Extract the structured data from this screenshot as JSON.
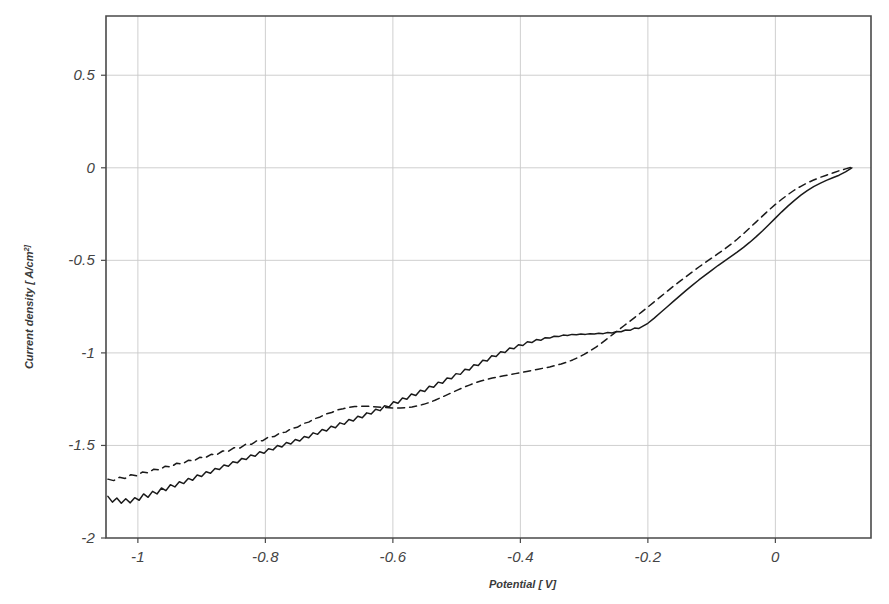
{
  "chart_data": {
    "type": "line",
    "title": "",
    "xlabel": "Potential [ V]",
    "ylabel": "Current density [ A/cm 2]",
    "ylabel_base": "Current density [ A/cm",
    "ylabel_exp": "2]",
    "xlim": [
      -1.05,
      0.15
    ],
    "ylim": [
      -2.0,
      0.82
    ],
    "grid": true,
    "legend": "none",
    "xticks": [
      -1,
      -0.8,
      -0.6,
      -0.4,
      -0.2,
      0
    ],
    "xticklabels": [
      "-1",
      "-0.8",
      "-0.6",
      "-0.4",
      "-0.2",
      "0"
    ],
    "yticks": [
      0.5,
      0,
      -0.5,
      -1,
      -1.5,
      -2
    ],
    "yticklabels": [
      "0.5",
      "0",
      "-0.5",
      "-1",
      "-1.5",
      "-2"
    ],
    "series": [
      {
        "name": "solid-curve",
        "style": "solid",
        "color": "#1a1a1a",
        "x": [
          -1.047,
          -1.04,
          -1.033,
          -1.026,
          -1.019,
          -1.012,
          -1.005,
          -0.998,
          -0.991,
          -0.984,
          -0.977,
          -0.97,
          -0.963,
          -0.956,
          -0.949,
          -0.942,
          -0.935,
          -0.928,
          -0.921,
          -0.914,
          -0.907,
          -0.9,
          -0.893,
          -0.886,
          -0.879,
          -0.872,
          -0.865,
          -0.858,
          -0.851,
          -0.844,
          -0.837,
          -0.83,
          -0.823,
          -0.816,
          -0.809,
          -0.802,
          -0.795,
          -0.788,
          -0.781,
          -0.774,
          -0.767,
          -0.76,
          -0.753,
          -0.746,
          -0.739,
          -0.732,
          -0.725,
          -0.718,
          -0.711,
          -0.704,
          -0.697,
          -0.69,
          -0.683,
          -0.676,
          -0.669,
          -0.662,
          -0.655,
          -0.648,
          -0.641,
          -0.634,
          -0.627,
          -0.62,
          -0.613,
          -0.606,
          -0.599,
          -0.592,
          -0.585,
          -0.578,
          -0.571,
          -0.564,
          -0.557,
          -0.55,
          -0.543,
          -0.536,
          -0.529,
          -0.522,
          -0.515,
          -0.508,
          -0.501,
          -0.494,
          -0.487,
          -0.48,
          -0.473,
          -0.466,
          -0.459,
          -0.452,
          -0.445,
          -0.438,
          -0.431,
          -0.424,
          -0.417,
          -0.41,
          -0.403,
          -0.396,
          -0.389,
          -0.382,
          -0.375,
          -0.368,
          -0.361,
          -0.354,
          -0.347,
          -0.34,
          -0.333,
          -0.326,
          -0.319,
          -0.312,
          -0.305,
          -0.298,
          -0.291,
          -0.284,
          -0.277,
          -0.27,
          -0.263,
          -0.256,
          -0.249,
          -0.242,
          -0.235,
          -0.228,
          -0.221,
          -0.214,
          -0.207,
          -0.2,
          -0.19,
          -0.18,
          -0.17,
          -0.16,
          -0.15,
          -0.14,
          -0.13,
          -0.12,
          -0.11,
          -0.1,
          -0.09,
          -0.08,
          -0.07,
          -0.06,
          -0.05,
          -0.04,
          -0.03,
          -0.02,
          -0.01,
          0.0,
          0.01,
          0.02,
          0.03,
          0.04,
          0.05,
          0.06,
          0.07,
          0.08,
          0.09,
          0.1,
          0.11,
          0.12
        ],
        "y": [
          -1.775,
          -1.806,
          -1.784,
          -1.812,
          -1.788,
          -1.81,
          -1.782,
          -1.796,
          -1.762,
          -1.78,
          -1.748,
          -1.762,
          -1.73,
          -1.744,
          -1.712,
          -1.724,
          -1.696,
          -1.706,
          -1.678,
          -1.688,
          -1.66,
          -1.668,
          -1.642,
          -1.65,
          -1.624,
          -1.63,
          -1.606,
          -1.612,
          -1.588,
          -1.594,
          -1.57,
          -1.576,
          -1.552,
          -1.558,
          -1.534,
          -1.542,
          -1.518,
          -1.524,
          -1.5,
          -1.508,
          -1.484,
          -1.492,
          -1.468,
          -1.476,
          -1.452,
          -1.458,
          -1.432,
          -1.44,
          -1.414,
          -1.422,
          -1.396,
          -1.404,
          -1.378,
          -1.386,
          -1.36,
          -1.368,
          -1.342,
          -1.35,
          -1.324,
          -1.33,
          -1.304,
          -1.312,
          -1.286,
          -1.292,
          -1.264,
          -1.272,
          -1.244,
          -1.25,
          -1.222,
          -1.23,
          -1.202,
          -1.208,
          -1.18,
          -1.186,
          -1.158,
          -1.164,
          -1.136,
          -1.14,
          -1.112,
          -1.116,
          -1.088,
          -1.092,
          -1.064,
          -1.068,
          -1.04,
          -1.044,
          -1.016,
          -1.02,
          -0.994,
          -0.998,
          -0.974,
          -0.978,
          -0.956,
          -0.96,
          -0.94,
          -0.944,
          -0.928,
          -0.932,
          -0.918,
          -0.92,
          -0.91,
          -0.912,
          -0.904,
          -0.906,
          -0.9,
          -0.902,
          -0.898,
          -0.9,
          -0.896,
          -0.898,
          -0.894,
          -0.896,
          -0.89,
          -0.892,
          -0.884,
          -0.886,
          -0.876,
          -0.878,
          -0.866,
          -0.868,
          -0.854,
          -0.84,
          -0.812,
          -0.782,
          -0.752,
          -0.722,
          -0.692,
          -0.662,
          -0.634,
          -0.606,
          -0.58,
          -0.554,
          -0.528,
          -0.504,
          -0.48,
          -0.456,
          -0.43,
          -0.402,
          -0.372,
          -0.34,
          -0.306,
          -0.272,
          -0.238,
          -0.206,
          -0.176,
          -0.148,
          -0.124,
          -0.102,
          -0.084,
          -0.068,
          -0.054,
          -0.04,
          -0.022,
          0.0
        ]
      },
      {
        "name": "dashed-curve",
        "style": "dashed",
        "color": "#1a1a1a",
        "x": [
          -1.047,
          -1.038,
          -1.029,
          -1.02,
          -1.011,
          -1.002,
          -0.993,
          -0.984,
          -0.975,
          -0.966,
          -0.957,
          -0.948,
          -0.939,
          -0.93,
          -0.921,
          -0.912,
          -0.903,
          -0.894,
          -0.885,
          -0.876,
          -0.867,
          -0.858,
          -0.849,
          -0.84,
          -0.831,
          -0.822,
          -0.813,
          -0.804,
          -0.795,
          -0.786,
          -0.777,
          -0.768,
          -0.759,
          -0.75,
          -0.741,
          -0.732,
          -0.723,
          -0.714,
          -0.705,
          -0.696,
          -0.687,
          -0.678,
          -0.669,
          -0.66,
          -0.651,
          -0.642,
          -0.633,
          -0.624,
          -0.615,
          -0.606,
          -0.597,
          -0.588,
          -0.579,
          -0.57,
          -0.561,
          -0.552,
          -0.543,
          -0.534,
          -0.525,
          -0.516,
          -0.507,
          -0.498,
          -0.489,
          -0.48,
          -0.471,
          -0.462,
          -0.453,
          -0.444,
          -0.435,
          -0.426,
          -0.417,
          -0.408,
          -0.399,
          -0.39,
          -0.381,
          -0.372,
          -0.363,
          -0.354,
          -0.345,
          -0.336,
          -0.327,
          -0.318,
          -0.309,
          -0.3,
          -0.291,
          -0.282,
          -0.273,
          -0.264,
          -0.255,
          -0.246,
          -0.237,
          -0.228,
          -0.219,
          -0.21,
          -0.2,
          -0.19,
          -0.18,
          -0.17,
          -0.16,
          -0.15,
          -0.14,
          -0.13,
          -0.12,
          -0.11,
          -0.1,
          -0.09,
          -0.08,
          -0.07,
          -0.06,
          -0.05,
          -0.04,
          -0.03,
          -0.02,
          -0.01,
          0.0,
          0.01,
          0.02,
          0.03,
          0.04,
          0.05,
          0.06,
          0.07,
          0.08,
          0.09,
          0.1,
          0.11,
          0.12
        ],
        "y": [
          -1.682,
          -1.69,
          -1.672,
          -1.678,
          -1.658,
          -1.664,
          -1.644,
          -1.648,
          -1.628,
          -1.632,
          -1.612,
          -1.616,
          -1.596,
          -1.6,
          -1.58,
          -1.584,
          -1.564,
          -1.566,
          -1.548,
          -1.55,
          -1.53,
          -1.532,
          -1.512,
          -1.514,
          -1.494,
          -1.494,
          -1.474,
          -1.474,
          -1.454,
          -1.452,
          -1.432,
          -1.428,
          -1.408,
          -1.402,
          -1.382,
          -1.374,
          -1.356,
          -1.346,
          -1.33,
          -1.322,
          -1.308,
          -1.302,
          -1.294,
          -1.29,
          -1.288,
          -1.288,
          -1.29,
          -1.292,
          -1.294,
          -1.296,
          -1.298,
          -1.298,
          -1.296,
          -1.292,
          -1.286,
          -1.278,
          -1.268,
          -1.256,
          -1.242,
          -1.228,
          -1.214,
          -1.2,
          -1.186,
          -1.174,
          -1.162,
          -1.152,
          -1.144,
          -1.136,
          -1.13,
          -1.124,
          -1.118,
          -1.112,
          -1.106,
          -1.1,
          -1.094,
          -1.088,
          -1.082,
          -1.076,
          -1.068,
          -1.06,
          -1.05,
          -1.038,
          -1.024,
          -1.008,
          -0.99,
          -0.97,
          -0.948,
          -0.924,
          -0.9,
          -0.876,
          -0.852,
          -0.828,
          -0.804,
          -0.78,
          -0.752,
          -0.724,
          -0.696,
          -0.668,
          -0.64,
          -0.614,
          -0.588,
          -0.562,
          -0.536,
          -0.512,
          -0.488,
          -0.464,
          -0.44,
          -0.414,
          -0.386,
          -0.356,
          -0.324,
          -0.292,
          -0.26,
          -0.228,
          -0.198,
          -0.17,
          -0.144,
          -0.12,
          -0.1,
          -0.082,
          -0.066,
          -0.052,
          -0.04,
          -0.028,
          -0.016,
          -0.006,
          0.004
        ]
      }
    ]
  }
}
